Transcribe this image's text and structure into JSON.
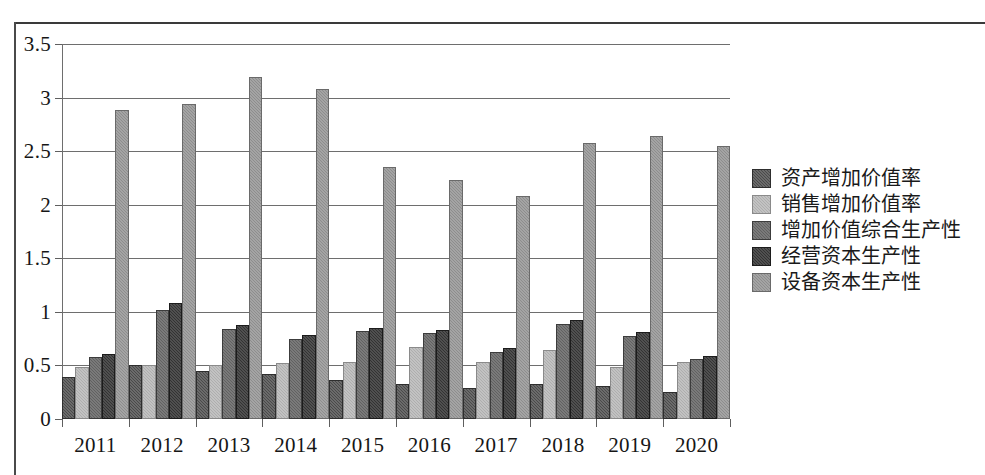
{
  "chart_data": {
    "type": "bar",
    "title": "",
    "subtitle": "",
    "xlabel": "",
    "ylabel": "",
    "ylim": [
      0,
      3.5
    ],
    "ytick_labels": [
      "0",
      "0.5",
      "1",
      "1.5",
      "2",
      "2.5",
      "3",
      "3.5"
    ],
    "ytick_values": [
      0,
      0.5,
      1,
      1.5,
      2,
      2.5,
      3,
      3.5
    ],
    "grid": true,
    "legend_position": "right",
    "categories": [
      "2011",
      "2012",
      "2013",
      "2014",
      "2015",
      "2016",
      "2017",
      "2018",
      "2019",
      "2020"
    ],
    "series": [
      {
        "name": "资产增加价值率",
        "color": "#4a4a4a",
        "values": [
          0.37,
          0.49,
          0.43,
          0.4,
          0.35,
          0.31,
          0.27,
          0.31,
          0.29,
          0.23
        ]
      },
      {
        "name": "销售增加价值率",
        "color": "#aeaeae",
        "values": [
          0.47,
          0.49,
          0.49,
          0.5,
          0.51,
          0.65,
          0.51,
          0.63,
          0.47,
          0.51
        ]
      },
      {
        "name": "增加价值综合生产性",
        "color": "#616161",
        "values": [
          0.56,
          1.0,
          0.82,
          0.73,
          0.8,
          0.78,
          0.61,
          0.87,
          0.76,
          0.54
        ]
      },
      {
        "name": "经营资本生产性",
        "color": "#333333",
        "values": [
          0.59,
          1.06,
          0.86,
          0.77,
          0.83,
          0.81,
          0.64,
          0.91,
          0.79,
          0.57
        ]
      },
      {
        "name": "设备资本生产性",
        "color": "#8d8d8d",
        "values": [
          2.87,
          2.92,
          3.17,
          3.06,
          2.33,
          2.21,
          2.06,
          2.56,
          2.62,
          2.53
        ]
      }
    ]
  }
}
